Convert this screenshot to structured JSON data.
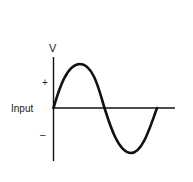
{
  "diagram": {
    "axis_label_y": "V",
    "positive_label": "+",
    "negative_label": "–",
    "signal_label": "Input",
    "colors": {
      "line": "#111111",
      "background": "#ffffff"
    }
  }
}
